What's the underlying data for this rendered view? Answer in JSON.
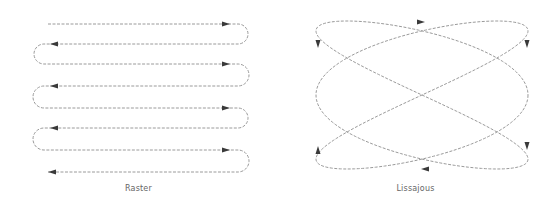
{
  "figure": {
    "panels": [
      {
        "id": "raster",
        "caption": "Raster",
        "description": "Serpentine raster scan: 8 horizontal passes alternating direction, joined by U-turn loops",
        "rows": 8,
        "row_y": [
          24,
          44,
          64,
          86,
          108,
          128,
          150,
          172
        ],
        "x_start": 48,
        "x_end": 238,
        "row_directions": [
          "right",
          "left",
          "right",
          "left",
          "right",
          "left",
          "right",
          "left"
        ]
      },
      {
        "id": "lissajous",
        "caption": "Lissajous",
        "description": "Lissajous scan curve with 3:2 frequency ratio and directional arrows",
        "frequency_ratio": "3:2",
        "arrow_count": 6
      }
    ],
    "colors": {
      "path": "#9a9a9a",
      "arrow": "#3a3a3a",
      "caption": "#666666",
      "background": "#ffffff"
    }
  }
}
